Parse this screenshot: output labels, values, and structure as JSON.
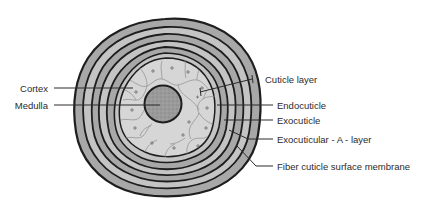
{
  "diagram": {
    "type": "hair-fiber-cross-section",
    "labels": {
      "cortex": "Cortex",
      "medulla": "Medulla",
      "cuticle_layer": "Cuticle layer",
      "endocuticle": "Endocuticle",
      "exocuticle": "Exocuticle",
      "exocuticular_a_layer": "Exocuticular - A - layer",
      "fiber_cuticle_surface_membrane": "Fiber cuticle surface membrane"
    },
    "colors": {
      "background": "#ffffff",
      "outline": "#1e1e1e",
      "cuticle_band": "#a8a8a8",
      "cuticle_band_light": "#c4c4c4",
      "cortex_fill": "#d6d6d6",
      "cell_lines": "#8c8c8c",
      "medulla_fill": "#9a9a9a",
      "label_text": "#2b2b2b"
    }
  }
}
